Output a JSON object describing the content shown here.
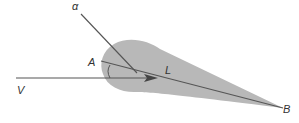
{
  "diagram": {
    "labels": {
      "alpha": "α",
      "A": "A",
      "L": "L",
      "V": "V",
      "B": "B"
    },
    "colors": {
      "background": "#ffffff",
      "shape_fill": "#b8b8b8",
      "line": "#555555",
      "text": "#333333"
    }
  }
}
